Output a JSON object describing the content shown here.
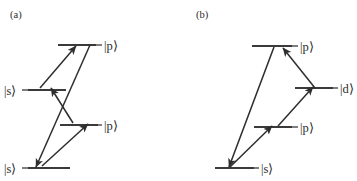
{
  "figure": {
    "background_color": "#ffffff",
    "line_color": "#3a3a3a",
    "arrow_color": "#2e2e2e",
    "text_color": "#2b2b2b",
    "width": 357,
    "height": 181
  },
  "panels": [
    {
      "tag": "(a)",
      "tag_x": 10,
      "tag_y": 18,
      "levels": [
        {
          "name": "p-upper",
          "label": "|p⟩",
          "line": {
            "x1": 58,
            "y1": 45,
            "x2": 96,
            "y2": 45
          },
          "label_x": 104,
          "label_y": 50
        },
        {
          "name": "s-upper",
          "label": "|s⟩",
          "line": {
            "x1": 28,
            "y1": 90,
            "x2": 66,
            "y2": 90
          },
          "label_x": 4,
          "label_y": 95,
          "label_anchor": "start"
        },
        {
          "name": "p-lower",
          "label": "|p⟩",
          "line": {
            "x1": 60,
            "y1": 125,
            "x2": 98,
            "y2": 125
          },
          "label_x": 104,
          "label_y": 130
        },
        {
          "name": "s-lower",
          "label": "|s⟩",
          "line": {
            "x1": 28,
            "y1": 168,
            "x2": 70,
            "y2": 168
          },
          "label_x": 4,
          "label_y": 173,
          "label_anchor": "start"
        }
      ],
      "transitions": [
        {
          "name": "s-upper-to-p-upper",
          "from": [
            40,
            88
          ],
          "to": [
            76,
            46
          ],
          "arrowhead": "end"
        },
        {
          "name": "s-lower-to-p-lower",
          "from": [
            42,
            166
          ],
          "to": [
            88,
            124
          ],
          "arrowhead": "end"
        },
        {
          "name": "p-lower-to-s-upper-crossing",
          "from": [
            73,
            123
          ],
          "to": [
            51,
            88
          ],
          "arrowhead": "end"
        },
        {
          "name": "p-upper-to-s-lower-crossing",
          "from": [
            90,
            45
          ],
          "to": [
            36,
            167
          ],
          "arrowhead": "end"
        }
      ]
    },
    {
      "tag": "(b)",
      "tag_x": 196,
      "tag_y": 18,
      "levels": [
        {
          "name": "p-upper",
          "label": "|p⟩",
          "line": {
            "x1": 252,
            "y1": 46,
            "x2": 292,
            "y2": 46
          },
          "label_x": 300,
          "label_y": 51
        },
        {
          "name": "d",
          "label": "|d⟩",
          "line": {
            "x1": 295,
            "y1": 88,
            "x2": 333,
            "y2": 88
          },
          "label_x": 340,
          "label_y": 93
        },
        {
          "name": "p-lower",
          "label": "|p⟩",
          "line": {
            "x1": 254,
            "y1": 127,
            "x2": 292,
            "y2": 127
          },
          "label_x": 300,
          "label_y": 132
        },
        {
          "name": "s",
          "label": "|s⟩",
          "line": {
            "x1": 215,
            "y1": 168,
            "x2": 254,
            "y2": 168
          },
          "label_x": 261,
          "label_y": 173
        }
      ],
      "transitions": [
        {
          "name": "s-to-p-upper",
          "from": [
            274,
            47
          ],
          "to": [
            229,
            167
          ],
          "arrowhead": "end"
        },
        {
          "name": "s-to-p-lower",
          "from": [
            230,
            167
          ],
          "to": [
            272,
            126
          ],
          "arrowhead": "end"
        },
        {
          "name": "p-lower-to-d",
          "from": [
            278,
            126
          ],
          "to": [
            313,
            87
          ],
          "arrowhead": "end"
        },
        {
          "name": "d-to-p-upper",
          "from": [
            315,
            88
          ],
          "to": [
            283,
            48
          ],
          "arrowhead": "end"
        }
      ]
    }
  ]
}
